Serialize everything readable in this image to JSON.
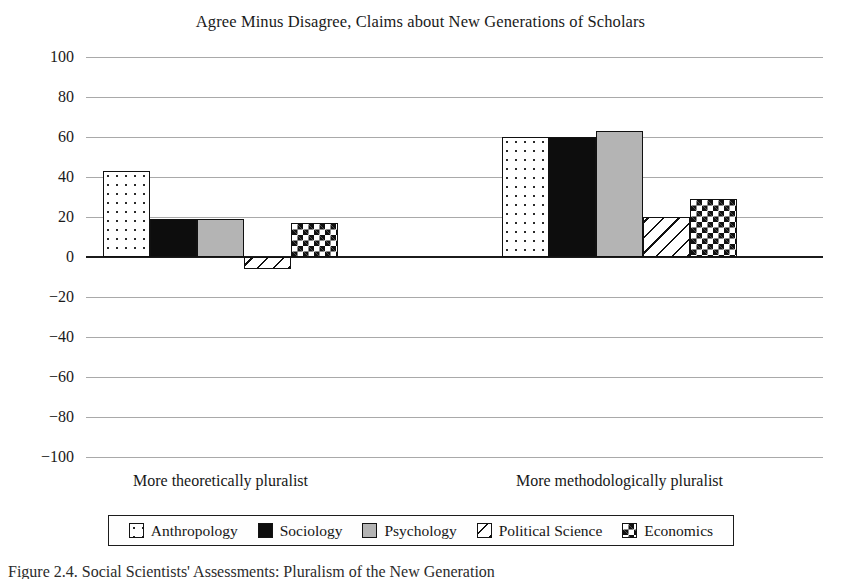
{
  "chart_data": {
    "type": "bar",
    "title": "Agree Minus Disagree, Claims about New Generations of Scholars",
    "xlabel": "",
    "ylabel": "",
    "ylim": [
      -100,
      100
    ],
    "yticks": [
      100,
      80,
      60,
      40,
      20,
      0,
      "−20",
      "−40",
      "−60",
      "−80",
      "−100"
    ],
    "ytick_values": [
      100,
      80,
      60,
      40,
      20,
      0,
      -20,
      -40,
      -60,
      -80,
      -100
    ],
    "grid": true,
    "legend_position": "bottom",
    "categories": [
      "More theoretically pluralist",
      "More methodologically pluralist"
    ],
    "series": [
      {
        "name": "Anthropology",
        "pattern": "dots",
        "values": [
          43,
          60
        ]
      },
      {
        "name": "Sociology",
        "pattern": "solid-black",
        "values": [
          19,
          60
        ]
      },
      {
        "name": "Psychology",
        "pattern": "gray",
        "values": [
          19,
          63
        ]
      },
      {
        "name": "Political Science",
        "pattern": "diagonal-hatch",
        "values": [
          -6,
          20
        ]
      },
      {
        "name": "Economics",
        "pattern": "checkerboard",
        "values": [
          17,
          29
        ]
      }
    ]
  },
  "caption": "Figure 2.4. Social Scientists' Assessments: Pluralism of the New Generation"
}
